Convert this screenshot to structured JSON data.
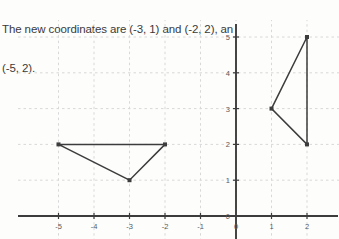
{
  "prompt": {
    "line1": "The new coordinates are (-3, 1) and (-2, 2), an",
    "line2": "(-5, 2)."
  },
  "graph": {
    "x_axis_label_0": "0",
    "y_axis_origin_label": "0"
  },
  "chart_data": {
    "type": "scatter",
    "title": "",
    "xlabel": "",
    "ylabel": "",
    "xlim": [
      -5.5,
      2.5
    ],
    "ylim": [
      -0.4,
      5.4
    ],
    "grid": true,
    "grid_style": "dashed",
    "grid_color": "#d8d8d8",
    "axis_color": "#3c3c3c",
    "shape_color": "#3c3c3c",
    "legend": "none",
    "xticks": [
      -5,
      -4,
      -3,
      -2,
      -1,
      0,
      1,
      2
    ],
    "xticklabels": [
      "-5",
      "-4",
      "-3",
      "-2",
      "-1",
      "0",
      "1",
      "2"
    ],
    "yticks": [
      0,
      1,
      2,
      3,
      4,
      5
    ],
    "yticklabels": [
      "0",
      "1",
      "2",
      "3",
      "4",
      "5"
    ],
    "series": [
      {
        "name": "image-triangle",
        "type": "polygon",
        "closed": true,
        "points": [
          [
            -5,
            2
          ],
          [
            -2,
            2
          ],
          [
            -3,
            1
          ]
        ],
        "vertex_labels": [
          "(-5, 2)",
          "(-2, 2)",
          "(-3, 1)"
        ]
      },
      {
        "name": "preimage-triangle",
        "type": "polygon",
        "closed": true,
        "points": [
          [
            1,
            3
          ],
          [
            2,
            5
          ],
          [
            2,
            2
          ]
        ],
        "vertex_labels": [
          "(1, 3)",
          "(2, 5)",
          "(2, 2)"
        ]
      }
    ]
  }
}
